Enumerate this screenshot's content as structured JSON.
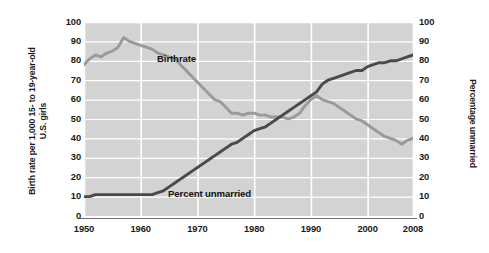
{
  "chart_data": {
    "type": "line",
    "title": "",
    "xlabel": "",
    "ylabel": "Birth rate per 1,000 15- to 19-year-old U.S. girls",
    "ylabel_line1": "Birth rate per 1,000 15- to 19-year-old",
    "ylabel_line2": "U.S. girls",
    "y2label": "Percentage unmarried",
    "grid": true,
    "legend": "inline-annotations",
    "xlim": [
      1950,
      2008
    ],
    "ylim": [
      0,
      100
    ],
    "y2lim": [
      0,
      100
    ],
    "xticks": [
      "1950",
      "1960",
      "1970",
      "1980",
      "1990",
      "2000",
      "2008"
    ],
    "xtick_values": [
      1950,
      1960,
      1970,
      1980,
      1990,
      2000,
      2008
    ],
    "yticks": [
      "100",
      "90",
      "80",
      "70",
      "60",
      "50",
      "40",
      "30",
      "20",
      "10",
      "0"
    ],
    "ytick_values": [
      100,
      90,
      80,
      70,
      60,
      50,
      40,
      30,
      20,
      10,
      0
    ],
    "y2ticks": [
      "100",
      "90",
      "80",
      "70",
      "60",
      "50",
      "40",
      "30",
      "20",
      "10",
      "0"
    ],
    "plot_bgcolor": "#d3d3d3",
    "gridline_color": "#ffffff",
    "series": [
      {
        "name": "Birthrate",
        "color": "#9a9a9a",
        "axis": "left",
        "annotation": "Birthrate",
        "x": [
          1950,
          1951,
          1952,
          1953,
          1954,
          1955,
          1956,
          1957,
          1958,
          1959,
          1960,
          1961,
          1962,
          1963,
          1964,
          1965,
          1966,
          1967,
          1968,
          1969,
          1970,
          1971,
          1972,
          1973,
          1974,
          1975,
          1976,
          1977,
          1978,
          1979,
          1980,
          1981,
          1982,
          1983,
          1984,
          1985,
          1986,
          1987,
          1988,
          1989,
          1990,
          1991,
          1992,
          1993,
          1994,
          1995,
          1996,
          1997,
          1998,
          1999,
          2000,
          2001,
          2002,
          2003,
          2004,
          2005,
          2006,
          2007,
          2008
        ],
        "values": [
          78,
          81,
          83,
          82,
          84,
          85,
          87,
          92,
          90,
          89,
          88,
          87,
          86,
          84,
          83,
          82,
          81,
          78,
          75,
          72,
          69,
          66,
          63,
          60,
          59,
          56,
          53,
          53,
          52,
          53,
          53,
          52,
          52,
          51,
          51,
          51,
          50,
          51,
          53,
          57,
          60,
          62,
          60,
          59,
          58,
          56,
          54,
          52,
          50,
          49,
          47,
          45,
          43,
          41,
          40,
          39,
          37,
          39,
          40
        ]
      },
      {
        "name": "Percent unmarried",
        "color": "#4a4a4a",
        "axis": "right",
        "annotation": "Percent unmarried",
        "x": [
          1950,
          1951,
          1952,
          1953,
          1954,
          1955,
          1956,
          1957,
          1958,
          1959,
          1960,
          1961,
          1962,
          1963,
          1964,
          1965,
          1966,
          1967,
          1968,
          1969,
          1970,
          1971,
          1972,
          1973,
          1974,
          1975,
          1976,
          1977,
          1978,
          1979,
          1980,
          1981,
          1982,
          1983,
          1984,
          1985,
          1986,
          1987,
          1988,
          1989,
          1990,
          1991,
          1992,
          1993,
          1994,
          1995,
          1996,
          1997,
          1998,
          1999,
          2000,
          2001,
          2002,
          2003,
          2004,
          2005,
          2006,
          2007,
          2008
        ],
        "values": [
          10,
          10,
          11,
          11,
          11,
          11,
          11,
          11,
          11,
          11,
          11,
          11,
          11,
          12,
          13,
          15,
          17,
          19,
          21,
          23,
          25,
          27,
          29,
          31,
          33,
          35,
          37,
          38,
          40,
          42,
          44,
          45,
          46,
          48,
          50,
          52,
          54,
          56,
          58,
          60,
          62,
          64,
          68,
          70,
          71,
          72,
          73,
          74,
          75,
          75,
          77,
          78,
          79,
          79,
          80,
          80,
          81,
          82,
          83
        ]
      }
    ]
  }
}
